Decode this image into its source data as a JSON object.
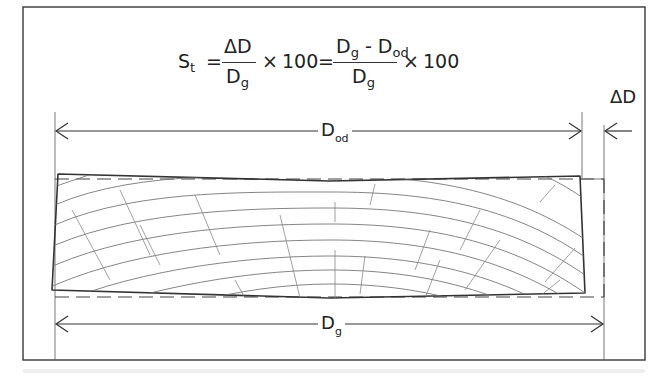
{
  "figure": {
    "type": "shrinkage-diagram",
    "formula": {
      "lhs": "S",
      "lhs_sub": "t",
      "equals": "=",
      "frac1_num": "ΔD",
      "frac1_den": "D",
      "frac1_den_sub": "g",
      "times": "×",
      "hundred": "100",
      "frac2_num_a": "D",
      "frac2_num_a_sub": "g",
      "frac2_minus": " - ",
      "frac2_num_b": "D",
      "frac2_num_b_sub": "od",
      "frac2_den": "D",
      "frac2_den_sub": "g"
    },
    "labels": {
      "delta_d": "ΔD",
      "dod_main": "D",
      "dod_sub": "od",
      "dg_main": "D",
      "dg_sub": "g"
    },
    "colors": {
      "line": "#333333",
      "grain": "#777777",
      "frame": "#444444"
    }
  }
}
